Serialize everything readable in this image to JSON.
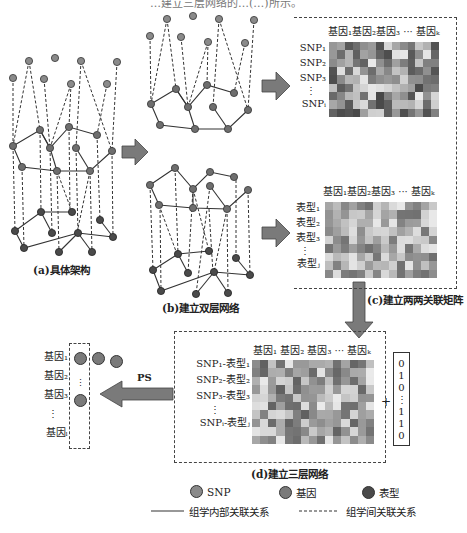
{
  "header_fragment": "…建立三层网络的…(…)所示。",
  "panels": {
    "a": {
      "caption": "(a)具体架构"
    },
    "b": {
      "caption": "(b)建立双层网络"
    },
    "c": {
      "caption": "(c)建立两两关联矩阵",
      "matrix1": {
        "col_header": "基因₁基因₂基因₃ ··· 基因ₖ",
        "rows": [
          "SNP₁",
          "SNP₂",
          "SNP₃",
          "⋮",
          "SNPᵢ"
        ]
      },
      "matrix2": {
        "col_header": "基因₁基因₂基因₃ ··· 基因ₖ",
        "rows": [
          "表型₁",
          "表型₂",
          "表型₃",
          "⋮",
          "表型ⱼ"
        ]
      }
    },
    "d": {
      "caption": "(d)建立三层网络",
      "col_header": "基因₁ 基因₂ 基因₃ ··· 基因ₖ",
      "rows": [
        "SNP₁-表型₁",
        "SNP₂-表型₂",
        "SNP₃-表型₃",
        "⋮",
        "SNPᵢ-表型ⱼ"
      ],
      "plus": "+",
      "vector": [
        "0",
        "1",
        "0",
        "⋮",
        "1",
        "1",
        "0"
      ]
    },
    "ps": {
      "arrow_label": "PS",
      "genes": [
        "基因₁",
        "基因₂",
        "基因₃",
        "⋮",
        "基因ₗ"
      ]
    }
  },
  "legend": {
    "snp": "SNP",
    "gene": "基因",
    "phenotype": "表型",
    "solid_line": "组学内部关联关系",
    "dashed_line": "组学间关联关系"
  },
  "colors": {
    "snp": "#8a8a8a",
    "gene": "#6e6e6e",
    "phenotype": "#4a4a4a",
    "arrow": "#7a7a7a"
  }
}
